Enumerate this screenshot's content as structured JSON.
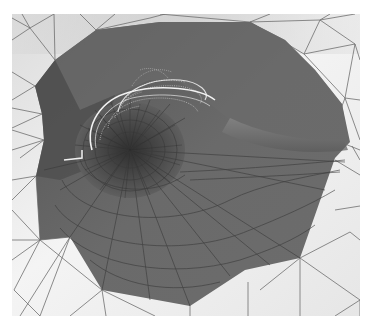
{
  "figure": {
    "caption_fragment": "",
    "colors": {
      "background": "#ffffff",
      "ground_light": "#e8e8e8",
      "ground_shadow": "#c8c8c8",
      "surface_dark": "#5a5a5a",
      "surface_mid": "#6e6e6e",
      "surface_light": "#7a7a7a",
      "mesh_line": "#3a3a3a",
      "ground_mesh_line": "#6f6f6f",
      "wireframe_vortex": "#f0f0f0"
    },
    "frame": {
      "x": 12,
      "y": 14,
      "width": 348,
      "height": 302
    }
  }
}
